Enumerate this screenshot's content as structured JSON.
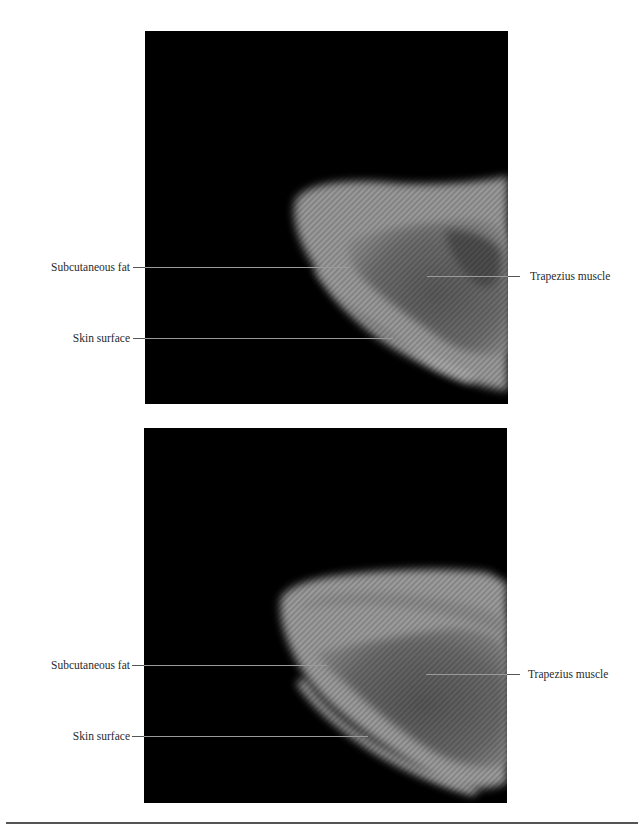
{
  "figures": [
    {
      "id": "top",
      "labels": {
        "subcutaneous_fat": "Subcutaneous fat",
        "skin_surface": "Skin surface",
        "trapezius_muscle": "Trapezius muscle"
      }
    },
    {
      "id": "bottom",
      "labels": {
        "subcutaneous_fat": "Subcutaneous fat",
        "skin_surface": "Skin surface",
        "trapezius_muscle": "Trapezius muscle"
      }
    }
  ],
  "colors": {
    "background": "#ffffff",
    "image_background": "#000000",
    "leader_line": "#9a9a9a",
    "footer_rule": "#555555"
  }
}
